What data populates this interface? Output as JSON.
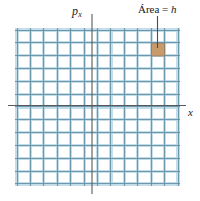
{
  "figure": {
    "background_color": "#ffffff",
    "axes": {
      "vertical_label": {
        "base": "p",
        "subscript": "x",
        "name": "momentum-axis-label"
      },
      "horizontal_label": {
        "text": "x",
        "name": "position-axis-label"
      },
      "axis_color": "#595959",
      "vertical_axis_x": 92,
      "vertical_axis_top": 14,
      "vertical_axis_bottom": 194,
      "horizontal_axis_y": 105.5,
      "horizontal_axis_left": 8,
      "horizontal_axis_right": 186
    },
    "grid": {
      "color_strong": "#5d8ea4",
      "color_soft": "#bcd8e4",
      "left": 17,
      "top": 30,
      "right": 178,
      "bottom": 184,
      "cell_width": 13.42,
      "cell_height": 12.83,
      "columns": 12,
      "rows": 12
    },
    "cell": {
      "label_text": "Área = ",
      "label_variable": "h",
      "fill_color": "#c89a6a",
      "stroke_color": "#8a7a66",
      "x": 151.3,
      "y": 43.2,
      "width": 13.42,
      "height": 12.83,
      "leader_line": {
        "color": "#4d4d4d",
        "x": 157.5,
        "y_start": 16,
        "y_end": 48
      }
    }
  }
}
